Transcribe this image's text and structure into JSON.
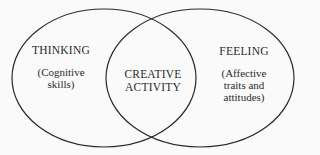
{
  "diagram": {
    "type": "venn",
    "sets": [
      {
        "id": "thinking",
        "title": "THINKING",
        "subtitle_lines": [
          "(Cognitive",
          "skills)"
        ]
      },
      {
        "id": "feeling",
        "title": "FEELING",
        "subtitle_lines": [
          "(Affective",
          "traits and",
          "attitudes)"
        ]
      }
    ],
    "intersection": {
      "title_lines": [
        "CREATIVE",
        "ACTIVITY"
      ]
    },
    "colors": {
      "stroke": "#2a2a2a",
      "background": "#fafafa",
      "text": "#2a2a2a"
    }
  }
}
